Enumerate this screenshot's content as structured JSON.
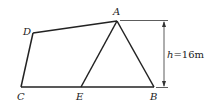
{
  "diagram": {
    "points": {
      "A": {
        "label": "A",
        "x": 117,
        "y": 21
      },
      "B": {
        "label": "B",
        "x": 154,
        "y": 87
      },
      "C": {
        "label": "C",
        "x": 21,
        "y": 87
      },
      "D": {
        "label": "D",
        "x": 33,
        "y": 33
      },
      "E": {
        "label": "E",
        "x": 81,
        "y": 87
      }
    },
    "segments": [
      "A-D",
      "D-C",
      "C-B",
      "A-B",
      "A-E"
    ],
    "height_annotation": {
      "variable": "h",
      "text": "=16m"
    }
  }
}
